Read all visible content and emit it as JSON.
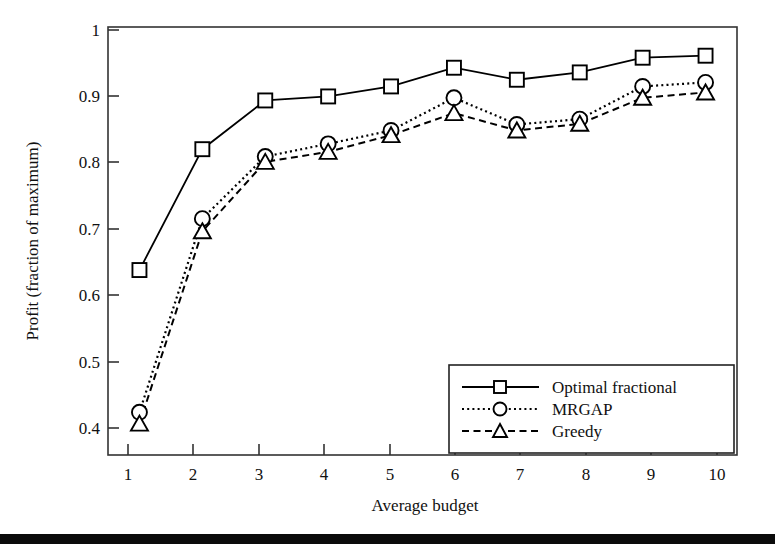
{
  "chart_data": {
    "type": "line",
    "title": "",
    "xlabel": "Average budget",
    "ylabel": "Profit (fraction of maximum)",
    "x": [
      1,
      2,
      3,
      4,
      5,
      6,
      7,
      8,
      9,
      10
    ],
    "xticklabels": [
      "1",
      "2",
      "3",
      "4",
      "5",
      "6",
      "7",
      "8",
      "9",
      "10"
    ],
    "yticklabels": [
      "0.4",
      "0.5",
      "0.6",
      "0.7",
      "0.8",
      "0.9",
      "1"
    ],
    "yticks": [
      0.4,
      0.5,
      0.6,
      0.7,
      0.8,
      0.9,
      1
    ],
    "xlim": [
      0.5,
      10.5
    ],
    "ylim": [
      0.359,
      1.0
    ],
    "grid": false,
    "legend_position": "lower right",
    "series": [
      {
        "name": "Optimal fractional",
        "marker": "square",
        "linestyle": "solid",
        "values": [
          0.636,
          0.817,
          0.89,
          0.896,
          0.911,
          0.939,
          0.921,
          0.932,
          0.954,
          0.957
        ]
      },
      {
        "name": "MRGAP",
        "marker": "circle",
        "linestyle": "dotted",
        "values": [
          0.423,
          0.713,
          0.806,
          0.825,
          0.845,
          0.894,
          0.854,
          0.862,
          0.911,
          0.917
        ]
      },
      {
        "name": "Greedy",
        "marker": "triangle",
        "linestyle": "dashed",
        "values": [
          0.406,
          0.694,
          0.798,
          0.813,
          0.838,
          0.871,
          0.845,
          0.855,
          0.894,
          0.902
        ]
      }
    ]
  },
  "figure": {
    "axis_color": "#333333",
    "line_color": "#000000",
    "marker_fill": "#ffffff",
    "rule_color": "#0b0b0b"
  }
}
